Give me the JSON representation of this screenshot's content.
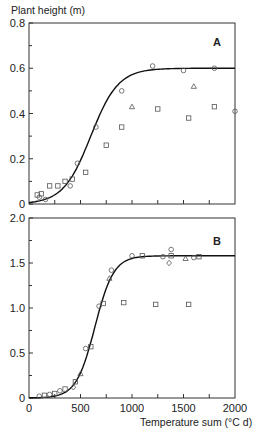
{
  "chart_data": [
    {
      "type": "scatter",
      "panel": "A",
      "title": "A",
      "ylabel": "Plant height (m)",
      "xlabel": "",
      "xlim": [
        0,
        2000
      ],
      "ylim": [
        0,
        0.8
      ],
      "yticks": [
        "0",
        "0.2",
        "0.4",
        "0.6",
        "0.8"
      ],
      "grid": false,
      "fit_curve": {
        "type": "logistic",
        "asymptote": 0.6,
        "midpoint": 600,
        "slope": 0.0075
      },
      "series": [
        {
          "name": "circles",
          "marker": "circle",
          "points": [
            [
              100,
              0.03
            ],
            [
              160,
              0.02
            ],
            [
              400,
              0.08
            ],
            [
              470,
              0.18
            ],
            [
              650,
              0.34
            ],
            [
              900,
              0.5
            ],
            [
              1200,
              0.61
            ],
            [
              1500,
              0.59
            ],
            [
              1800,
              0.6
            ],
            [
              2000,
              0.41
            ]
          ]
        },
        {
          "name": "squares",
          "marker": "square",
          "points": [
            [
              80,
              0.04
            ],
            [
              120,
              0.045
            ],
            [
              200,
              0.08
            ],
            [
              280,
              0.08
            ],
            [
              350,
              0.1
            ],
            [
              420,
              0.11
            ],
            [
              550,
              0.14
            ],
            [
              750,
              0.26
            ],
            [
              900,
              0.34
            ],
            [
              1250,
              0.42
            ],
            [
              1550,
              0.38
            ],
            [
              1800,
              0.43
            ]
          ]
        },
        {
          "name": "triangles",
          "marker": "triangle",
          "points": [
            [
              1000,
              0.43
            ],
            [
              1600,
              0.52
            ]
          ]
        }
      ]
    },
    {
      "type": "scatter",
      "panel": "B",
      "title": "B",
      "ylabel": "",
      "xlabel": "Temperature sum (°C d)",
      "xlim": [
        0,
        2000
      ],
      "ylim": [
        0,
        2.0
      ],
      "yticks": [
        "0",
        "0.5",
        "1.0",
        "1.5",
        "2.0"
      ],
      "xticks": [
        "0",
        "500",
        "1000",
        "1500",
        "2000"
      ],
      "grid": false,
      "fit_curve": {
        "type": "logistic",
        "asymptote": 1.58,
        "midpoint": 640,
        "slope": 0.011
      },
      "series": [
        {
          "name": "circles",
          "marker": "circle",
          "points": [
            [
              100,
              0.02
            ],
            [
              200,
              0.04
            ],
            [
              300,
              0.08
            ],
            [
              550,
              0.55
            ],
            [
              680,
              1.02
            ],
            [
              800,
              1.42
            ],
            [
              1000,
              1.58
            ],
            [
              1300,
              1.57
            ],
            [
              1380,
              1.65
            ],
            [
              1600,
              1.56
            ]
          ]
        },
        {
          "name": "squares",
          "marker": "square",
          "points": [
            [
              150,
              0.03
            ],
            [
              250,
              0.05
            ],
            [
              350,
              0.1
            ],
            [
              450,
              0.18
            ],
            [
              600,
              0.57
            ],
            [
              720,
              1.05
            ],
            [
              920,
              1.06
            ],
            [
              1100,
              1.58
            ],
            [
              1230,
              1.04
            ],
            [
              1380,
              1.58
            ],
            [
              1550,
              1.04
            ],
            [
              1650,
              1.57
            ]
          ]
        },
        {
          "name": "triangles",
          "marker": "triangle",
          "points": [
            [
              500,
              0.27
            ],
            [
              780,
              1.33
            ],
            [
              1520,
              1.55
            ]
          ]
        },
        {
          "name": "diamonds",
          "marker": "diamond",
          "points": [
            [
              430,
              0.12
            ],
            [
              1360,
              1.5
            ]
          ]
        }
      ]
    }
  ],
  "labels": {
    "ylabel": "Plant height (m)",
    "xlabel": "Temperature sum (°C d)",
    "panel_a": "A",
    "panel_b": "B"
  }
}
